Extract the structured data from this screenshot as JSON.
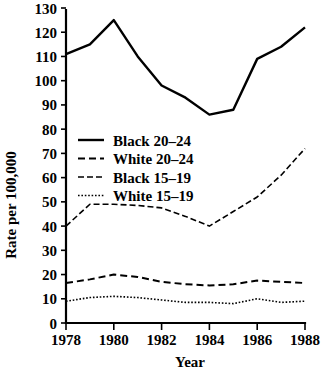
{
  "chart_data": {
    "type": "line",
    "title": "",
    "xlabel": "Year",
    "ylabel": "Rate per 100,000",
    "xlim": [
      1978,
      1988
    ],
    "ylim": [
      0,
      130
    ],
    "grid": false,
    "legend_position": "upper-left-inside",
    "x": [
      1978,
      1979,
      1980,
      1981,
      1982,
      1983,
      1984,
      1985,
      1986,
      1987,
      1988
    ],
    "x_tick_labels": [
      "1978",
      "1980",
      "1982",
      "1984",
      "1986",
      "1988"
    ],
    "x_tick_values": [
      1978,
      1980,
      1982,
      1984,
      1986,
      1988
    ],
    "x_minor_tick_values": [
      1979,
      1981,
      1983,
      1985,
      1987
    ],
    "y_tick_labels": [
      "0",
      "10",
      "20",
      "30",
      "40",
      "50",
      "60",
      "70",
      "80",
      "90",
      "100",
      "110",
      "120",
      "130"
    ],
    "y_tick_values": [
      0,
      10,
      20,
      30,
      40,
      50,
      60,
      70,
      80,
      90,
      100,
      110,
      120,
      130
    ],
    "series": [
      {
        "name": "Black 20–24",
        "style": "solid",
        "color": "#000000",
        "values": [
          111,
          115,
          125,
          110,
          98,
          93,
          86,
          88,
          109,
          114,
          122
        ]
      },
      {
        "name": "White 20–24",
        "style": "dashed",
        "color": "#000000",
        "values": [
          16.5,
          18,
          20,
          19,
          17,
          16,
          15.5,
          16,
          17.5,
          17,
          16.5
        ]
      },
      {
        "name": "Black 15–19",
        "style": "dash-dot",
        "color": "#000000",
        "values": [
          40,
          49,
          49,
          48.5,
          47.5,
          44,
          40,
          46,
          52,
          61,
          72
        ]
      },
      {
        "name": "White 15–19",
        "style": "dotted",
        "color": "#000000",
        "values": [
          9,
          10.5,
          11,
          10.5,
          9.5,
          8.5,
          8.5,
          8,
          10,
          8.5,
          9
        ]
      }
    ]
  },
  "legend": {
    "entries": [
      {
        "label": "Black 20–24",
        "style": "solid"
      },
      {
        "label": "White 20–24",
        "style": "dashed"
      },
      {
        "label": "Black 15–19",
        "style": "dash-dot"
      },
      {
        "label": "White 15–19",
        "style": "dotted"
      }
    ]
  },
  "axes": {
    "x_title": "Year",
    "y_title": "Rate per 100,000"
  }
}
